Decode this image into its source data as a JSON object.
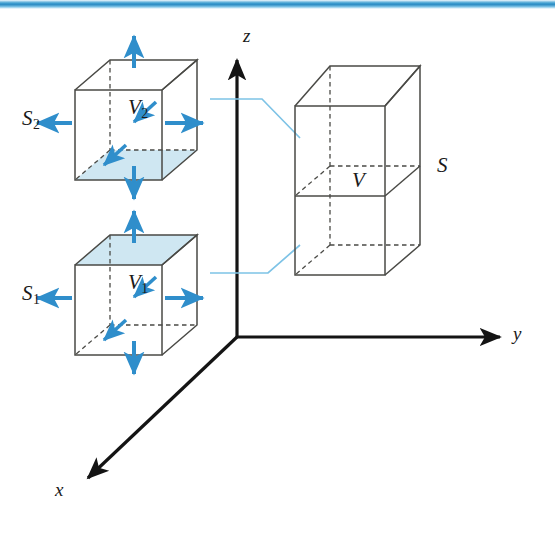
{
  "figure": {
    "top_rule_color": "#2f8dc4",
    "colors": {
      "edge": "#4a4a46",
      "arrow_blue": "#2f8ecb",
      "shade_blue": "#cfe7f2",
      "connector_blue": "#7ec3e6",
      "axis_black": "#141414"
    },
    "axes": {
      "z_label": "z",
      "y_label": "y",
      "x_label": "x",
      "origin": {
        "x": 237,
        "y": 337
      }
    },
    "left_upper_cube": {
      "volume_label": "V",
      "volume_sub": "2",
      "surface_label": "S",
      "surface_sub": "2",
      "shaded_face": "bottom",
      "arrows": [
        "up",
        "down",
        "left",
        "right",
        "into-back-upper",
        "into-back-lower"
      ]
    },
    "left_lower_cube": {
      "volume_label": "V",
      "volume_sub": "1",
      "surface_label": "S",
      "surface_sub": "1",
      "shaded_face": "top",
      "arrows": [
        "up",
        "down",
        "left",
        "right",
        "into-back-upper",
        "into-back-lower"
      ]
    },
    "right_box": {
      "volume_label": "V",
      "surface_label": "S",
      "description": "tall box formed by stacking the two cubes, mid-level divider line visible"
    },
    "connectors": [
      {
        "name": "upper-connector",
        "from": "upper cube right face",
        "to": "right box upper region"
      },
      {
        "name": "lower-connector",
        "from": "lower cube right face",
        "to": "right box lower region"
      }
    ]
  }
}
